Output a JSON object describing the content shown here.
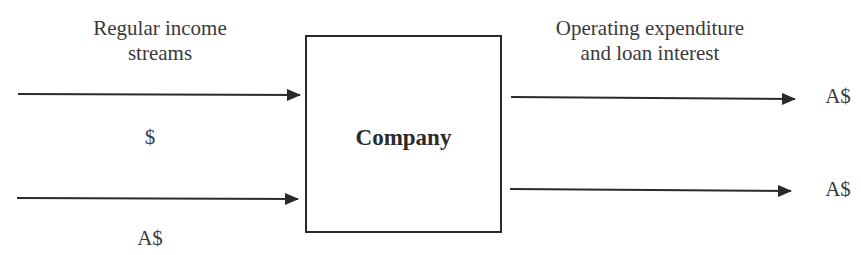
{
  "diagram": {
    "inputs_title": "Regular income streams",
    "inputs_title_lines": [
      "Regular income",
      "streams"
    ],
    "input_currency_top": "$",
    "input_currency_bottom": "A$",
    "entity": "Company",
    "outputs_title_lines": [
      "Operating expenditure",
      "and loan interest"
    ],
    "output_currency_top": "A$",
    "output_currency_bottom": "A$",
    "line_color": "#2a2a2a"
  }
}
